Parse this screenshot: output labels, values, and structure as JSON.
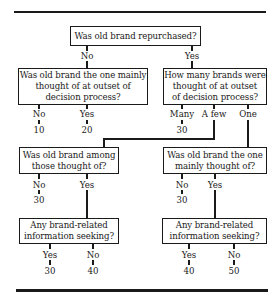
{
  "diagram": {
    "q1": {
      "text": "Was old brand repurchased?",
      "no": "No",
      "yes": "Yes"
    },
    "q2": {
      "text": "Was old brand the one mainly\nthought of at outset of\ndecision process?",
      "no": "No",
      "yes": "Yes",
      "no_value": "10",
      "yes_value": "20"
    },
    "q3": {
      "text": "How many brands were\nthought of at outset\nof decision process?",
      "many": "Many",
      "few": "A few",
      "one": "One",
      "many_value": "30"
    },
    "q4": {
      "text": "Was old brand among\nthose thought of?",
      "no": "No",
      "yes": "Yes",
      "no_value": "30"
    },
    "q5": {
      "text": "Was old brand the one\nmainly thought of?",
      "no": "No",
      "yes": "Yes",
      "no_value": "30"
    },
    "q6": {
      "text": "Any brand-related\ninformation seeking?",
      "yes": "Yes",
      "no": "No",
      "yes_value": "30",
      "no_value": "40"
    },
    "q7": {
      "text": "Any brand-related\ninformation seeking?",
      "yes": "Yes",
      "no": "No",
      "yes_value": "40",
      "no_value": "50"
    }
  }
}
